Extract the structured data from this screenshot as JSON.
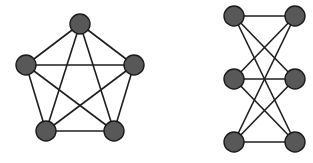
{
  "diagrams": [
    {
      "name": "complete-graph-k5",
      "nodes": [
        {
          "id": "top",
          "x": 80,
          "y": 24
        },
        {
          "id": "left",
          "x": 26,
          "y": 65
        },
        {
          "id": "right",
          "x": 134,
          "y": 65
        },
        {
          "id": "bottom-left",
          "x": 46,
          "y": 131
        },
        {
          "id": "bottom-right",
          "x": 114,
          "y": 131
        }
      ],
      "edges": [
        [
          "top",
          "left"
        ],
        [
          "top",
          "right"
        ],
        [
          "top",
          "bottom-left"
        ],
        [
          "top",
          "bottom-right"
        ],
        [
          "left",
          "right"
        ],
        [
          "left",
          "bottom-left"
        ],
        [
          "left",
          "bottom-right"
        ],
        [
          "right",
          "bottom-left"
        ],
        [
          "right",
          "bottom-right"
        ],
        [
          "bottom-left",
          "bottom-right"
        ]
      ]
    },
    {
      "name": "complete-bipartite-graph-k33",
      "nodes": [
        {
          "id": "top-left",
          "x": 234,
          "y": 16
        },
        {
          "id": "top-right",
          "x": 295,
          "y": 16
        },
        {
          "id": "middle-left",
          "x": 234,
          "y": 79
        },
        {
          "id": "middle-right",
          "x": 295,
          "y": 79
        },
        {
          "id": "bottom-left",
          "x": 234,
          "y": 142
        },
        {
          "id": "bottom-right",
          "x": 295,
          "y": 142
        }
      ],
      "edges": [
        [
          "top-left",
          "top-right"
        ],
        [
          "top-left",
          "middle-right"
        ],
        [
          "top-left",
          "bottom-right"
        ],
        [
          "middle-left",
          "top-right"
        ],
        [
          "middle-left",
          "middle-right"
        ],
        [
          "middle-left",
          "bottom-right"
        ],
        [
          "bottom-left",
          "top-right"
        ],
        [
          "bottom-left",
          "middle-right"
        ],
        [
          "bottom-left",
          "bottom-right"
        ]
      ]
    }
  ],
  "style": {
    "node_radius": 10,
    "node_fill": "#585858",
    "node_stroke": "#1a1a1a",
    "edge_color": "#1e1e1e",
    "background": "#ffffff"
  }
}
